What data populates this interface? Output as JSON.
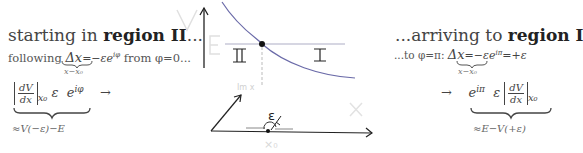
{
  "left": {
    "heading_prefix": "starting in",
    "heading_bold": "region II",
    "heading_suffix": "...",
    "following_prefix": "following",
    "delta": "Δx",
    "delta_rhs": "=−εe",
    "delta_exp": "iφ",
    "delta_suffix": " from φ=0...",
    "underbrace_label": "x−x₀",
    "deriv_num": "dV",
    "deriv_den": "dx",
    "deriv_sub": "x₀",
    "epsilon": "ε",
    "exp_base": "e",
    "exp_power": "iφ",
    "arrow": "→",
    "approx_label": "≈V(−ε)−E"
  },
  "right": {
    "heading_prefix": "...arriving to",
    "heading_bold": "region I",
    "to_prefix": "...to φ=π:",
    "delta": "Δx",
    "delta_rhs": "=−εe",
    "delta_exp": "iπ",
    "delta_suffix": "=+ε",
    "underbrace_label": "x−x₀",
    "arrow": "→",
    "exp_base": "e",
    "exp_power": "iπ",
    "epsilon": "ε",
    "deriv_num": "dV",
    "deriv_den": "dx",
    "deriv_sub": "x₀",
    "approx_label": "≈E−V(+ε)"
  },
  "diagram": {
    "axis_v": "V",
    "axis_x": "X",
    "energy": "E",
    "region_left": "II",
    "region_right": "I",
    "imag_label": "Im x",
    "epsilon_label": "ε",
    "x0_label": "x₀",
    "curve_color": "#6a6aa8",
    "energy_line_color": "#c8c8d8",
    "faint_label_color": "#d8d8d8"
  }
}
